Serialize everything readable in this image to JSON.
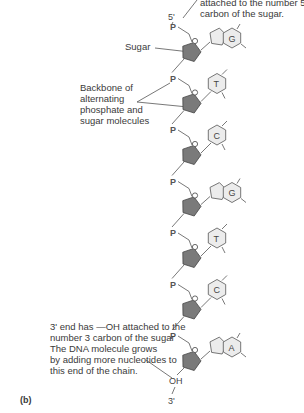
{
  "labels": {
    "top_note_line1": "attached to the number 5",
    "top_note_line2": "carbon of the sugar.",
    "five_prime": "5'",
    "sugar": "Sugar",
    "backbone_line1": "Backbone of",
    "backbone_line2": "alternating",
    "backbone_line3": "phosphate and",
    "backbone_line4": "sugar molecules",
    "bottom_note_line1": "3' end has —OH attached to the",
    "bottom_note_line2": "number 3 carbon of the sugar",
    "bottom_note_line3": "The DNA molecule grows",
    "bottom_note_line4": "by adding more nucleotides to",
    "bottom_note_line5": "this end of the chain.",
    "oh": "OH",
    "three_prime": "3'",
    "panel": "(b)"
  },
  "phosphate_symbol": "P",
  "nucleotides": [
    {
      "base": "G",
      "type": "purine"
    },
    {
      "base": "T",
      "type": "pyrimidine"
    },
    {
      "base": "C",
      "type": "pyrimidine"
    },
    {
      "base": "G",
      "type": "purine"
    },
    {
      "base": "T",
      "type": "pyrimidine"
    },
    {
      "base": "C",
      "type": "pyrimidine"
    },
    {
      "base": "A",
      "type": "purine"
    }
  ],
  "colors": {
    "sugar_fill": "#7a7a7a",
    "base_fill": "#ececec",
    "line": "#555555"
  }
}
